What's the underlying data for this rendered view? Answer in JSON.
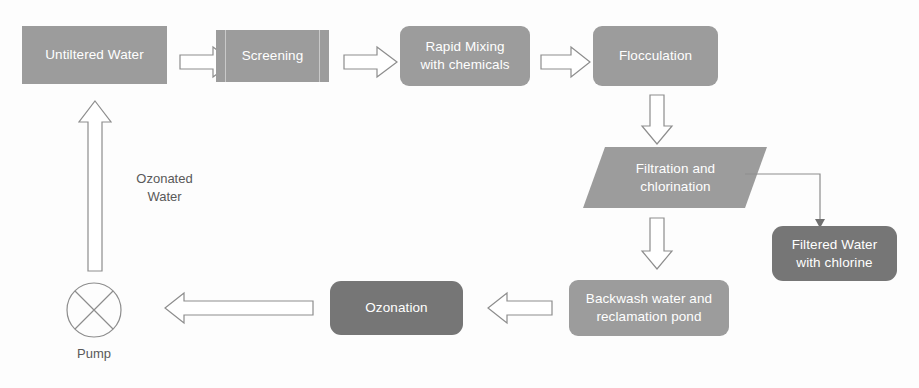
{
  "diagram": {
    "colors": {
      "node_fill": "#9c9c9c",
      "node_fill_dark": "#767676",
      "node_text": "#ffffff",
      "label_text": "#595959",
      "arrow_stroke": "#8d8d8d",
      "arrow_fill": "#ffffff",
      "background": "#fdfdfd"
    },
    "nodes": [
      {
        "id": "unfiltered-water",
        "label": "Untiltered Water",
        "shape": "rect"
      },
      {
        "id": "screening",
        "label": "Screening",
        "shape": "process"
      },
      {
        "id": "rapid-mixing",
        "label": "Rapid Mixing\nwith chemicals",
        "shape": "rounded"
      },
      {
        "id": "flocculation",
        "label": "Flocculation",
        "shape": "rounded"
      },
      {
        "id": "filtration",
        "label": "Filtration and\nchlorination",
        "shape": "parallelogram"
      },
      {
        "id": "filtered-water",
        "label": "Filtered Water\nwith chlorine",
        "shape": "rounded-dark"
      },
      {
        "id": "backwash",
        "label": "Backwash water and\nreclamation pond",
        "shape": "rounded"
      },
      {
        "id": "ozonation",
        "label": "Ozonation",
        "shape": "rounded-dark"
      },
      {
        "id": "pump",
        "label": "Pump",
        "shape": "circle-cross"
      }
    ],
    "labels": [
      {
        "id": "ozonated-water",
        "text": "Ozonated\nWater"
      },
      {
        "id": "pump-label",
        "text": "Pump"
      }
    ],
    "arrows": [
      {
        "id": "unfiltered-to-screening",
        "direction": "right"
      },
      {
        "id": "screening-to-rapid-mixing",
        "direction": "right"
      },
      {
        "id": "rapid-mixing-to-flocculation",
        "direction": "right"
      },
      {
        "id": "flocculation-to-filtration",
        "direction": "down"
      },
      {
        "id": "filtration-to-backwash",
        "direction": "down"
      },
      {
        "id": "backwash-to-ozonation",
        "direction": "left"
      },
      {
        "id": "ozonation-to-pump",
        "direction": "left"
      },
      {
        "id": "pump-to-unfiltered-water",
        "direction": "up"
      },
      {
        "id": "filtration-to-filtered-water",
        "direction": "elbow-down"
      }
    ]
  }
}
